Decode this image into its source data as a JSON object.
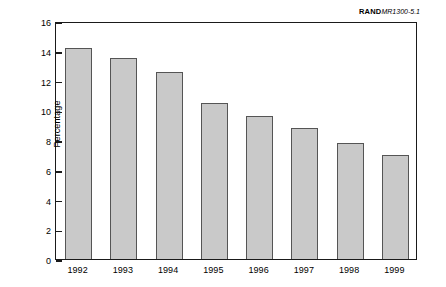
{
  "credit": {
    "brand": "RAND",
    "document_id": "MR1300-5.1"
  },
  "chart_data": {
    "type": "bar",
    "title": "",
    "xlabel": "",
    "ylabel": "Percentage",
    "categories": [
      "1992",
      "1993",
      "1994",
      "1995",
      "1996",
      "1997",
      "1998",
      "1999"
    ],
    "values": [
      14.2,
      13.5,
      12.6,
      10.5,
      9.6,
      8.8,
      7.8,
      7.0
    ],
    "ylim": [
      0,
      16
    ],
    "ytick_step": 2,
    "ytick_labels": [
      "0",
      "2",
      "4",
      "6",
      "8",
      "10",
      "12",
      "14",
      "16"
    ],
    "grid": false,
    "legend": "none",
    "bar_fill_color": "#c9c9c9",
    "bar_edge_color": "#555555",
    "frame_color": "#1a1a1a",
    "background_color": "#ffffff"
  }
}
